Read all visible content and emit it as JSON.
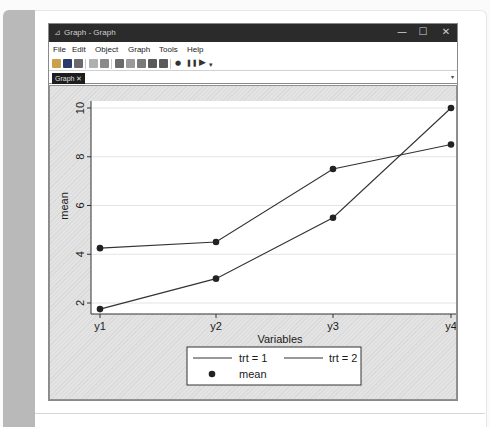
{
  "window": {
    "title": "Graph - Graph",
    "controls": {
      "minimize": "—",
      "maximize": "☐",
      "close": "✕"
    }
  },
  "menubar": {
    "items": [
      {
        "label": "File"
      },
      {
        "label": "Edit"
      },
      {
        "label": "Object"
      },
      {
        "label": "Graph"
      },
      {
        "label": "Tools"
      },
      {
        "label": "Help"
      }
    ]
  },
  "toolbar": {
    "buttons": [
      "open-icon",
      "save-icon",
      "print-icon",
      "copy-icon",
      "paste-icon",
      "graph-editor-icon",
      "rename-icon",
      "scheme-icon",
      "apply-recording-icon",
      "undo-recording-icon",
      "record-icon",
      "pause-icon",
      "play-icon"
    ],
    "record_glyph": "●",
    "pause_glyph": "❚❚",
    "play_glyph": "▶",
    "dropdown_glyph": "▾"
  },
  "tabs": [
    {
      "label": "Graph ✕",
      "active": true
    }
  ],
  "tab_dropdown_glyph": "▾",
  "chart_data": {
    "type": "line",
    "title": "",
    "xlabel": "Variables",
    "ylabel": "mean",
    "categories": [
      "y1",
      "y2",
      "y3",
      "y4"
    ],
    "y_ticks": [
      2,
      4,
      6,
      8,
      10
    ],
    "ylim": [
      1.5,
      10.3
    ],
    "grid": true,
    "series": [
      {
        "name": "trt = 1",
        "values": [
          4.25,
          4.5,
          7.5,
          8.5
        ],
        "color": "#333333",
        "marker": "circle"
      },
      {
        "name": "trt = 2",
        "values": [
          1.75,
          3.0,
          5.5,
          10.0
        ],
        "color": "#333333",
        "marker": "circle"
      }
    ],
    "legend": {
      "position": "bottom",
      "entries": [
        "trt = 1",
        "trt = 2",
        "mean"
      ]
    }
  }
}
